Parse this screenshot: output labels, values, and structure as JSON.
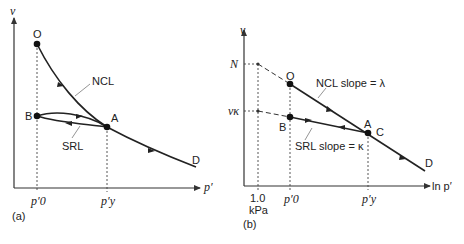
{
  "figure": {
    "panel_a": {
      "caption": "(a)",
      "y_axis_label": "v",
      "x_axis_label": "p′",
      "x_ticks": [
        "p′0",
        "p′y"
      ],
      "points": {
        "O": "O",
        "A": "A",
        "B": "B",
        "D": "D"
      },
      "curves": {
        "ncl": "NCL",
        "srl": "SRL"
      }
    },
    "panel_b": {
      "caption": "(b)",
      "y_axis_label": "v",
      "x_axis_label": "ln p′",
      "y_ticks": {
        "N": "N",
        "v_kappa": "vκ"
      },
      "x_ticks": {
        "one": "1.0",
        "one_unit": "kPa",
        "p0": "p′0",
        "py": "p′y"
      },
      "points": {
        "O": "O",
        "A": "A",
        "B": "B",
        "C": "C",
        "D": "D"
      },
      "lines": {
        "ncl": "NCL slope = λ",
        "srl": "SRL slope = κ"
      }
    }
  }
}
